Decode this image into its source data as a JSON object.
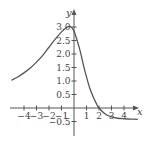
{
  "chart_data": {
    "type": "line",
    "title": "",
    "xlabel": "x",
    "ylabel": "y",
    "xlim": [
      -5.2,
      5.2
    ],
    "ylim": [
      -0.75,
      3.35
    ],
    "grid": false,
    "legend": null,
    "x_ticks": [
      -4,
      -3,
      -2,
      -1,
      1,
      2,
      3,
      4
    ],
    "x_tick_labels": [
      "−4",
      "−3",
      "−2",
      "−1",
      "1",
      "2",
      "3",
      "4"
    ],
    "y_ticks": [
      3.0,
      2.5,
      2.0,
      1.5,
      1.0,
      0.5,
      -0.5
    ],
    "y_tick_labels": [
      "3.0",
      "2.5",
      "2.0",
      "1.5",
      "1.0",
      "0.5",
      "−0.5"
    ],
    "series": [
      {
        "name": "f(x)",
        "color": "#555555",
        "x": [
          -5.0,
          -4.5,
          -4.0,
          -3.5,
          -3.0,
          -2.5,
          -2.0,
          -1.5,
          -1.0,
          -0.6,
          -0.3,
          0.0,
          0.25,
          0.5,
          0.75,
          1.0,
          1.25,
          1.5,
          1.75,
          2.0,
          2.5,
          3.0,
          3.5,
          4.0,
          4.5,
          5.1
        ],
        "y": [
          1.03,
          1.15,
          1.3,
          1.48,
          1.7,
          1.95,
          2.25,
          2.55,
          2.82,
          2.98,
          3.02,
          2.85,
          2.5,
          2.1,
          1.6,
          1.15,
          0.75,
          0.45,
          0.2,
          0.0,
          -0.22,
          -0.33,
          -0.38,
          -0.4,
          -0.41,
          -0.42
        ]
      }
    ]
  },
  "layout": {
    "origin_px": [
      74,
      108
    ],
    "x_scale_px": 12.5,
    "y_scale_px": 27,
    "axis_color": "#555555"
  }
}
